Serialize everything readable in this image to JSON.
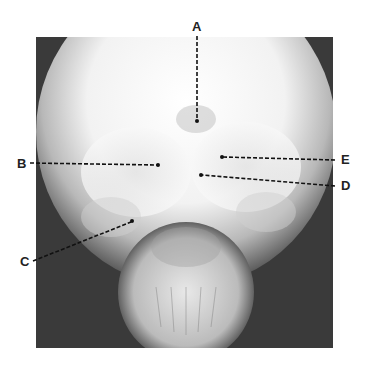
{
  "figure": {
    "type": "skull-radiograph-frontal",
    "labels": [
      {
        "id": "A",
        "text": "A",
        "label_x": 197,
        "label_y": 27,
        "target_x": 197,
        "target_y": 121
      },
      {
        "id": "B",
        "text": "B",
        "label_x": 22,
        "label_y": 164,
        "target_x": 158,
        "target_y": 165
      },
      {
        "id": "C",
        "text": "C",
        "label_x": 25,
        "label_y": 262,
        "target_x": 132,
        "target_y": 221
      },
      {
        "id": "D",
        "text": "D",
        "label_x": 346,
        "label_y": 186,
        "target_x": 201,
        "target_y": 175
      },
      {
        "id": "E",
        "text": "E",
        "label_x": 346,
        "label_y": 160,
        "target_x": 222,
        "target_y": 157
      }
    ]
  }
}
